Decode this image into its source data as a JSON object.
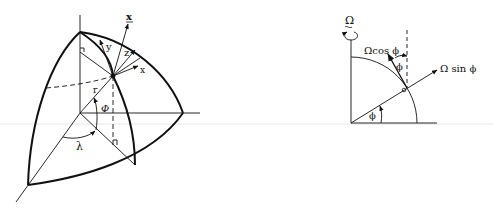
{
  "figures": [
    {
      "id": "sphere-octant",
      "labels": {
        "x_bold": "x",
        "y": "y",
        "z": "z",
        "x": "x",
        "r": "r",
        "phi": "Φ",
        "lambda": "λ"
      }
    },
    {
      "id": "rotation-decomposition",
      "labels": {
        "omega": "Ω",
        "omega_cos_phi": "Ωcos ϕ",
        "omega_sin_phi": "Ω sin ϕ",
        "phi_upper": "ϕ",
        "phi_lower": "ϕ"
      }
    }
  ],
  "colors": {
    "ink": "#111111",
    "background": "#ffffff",
    "rule": "#e6e6e6"
  }
}
